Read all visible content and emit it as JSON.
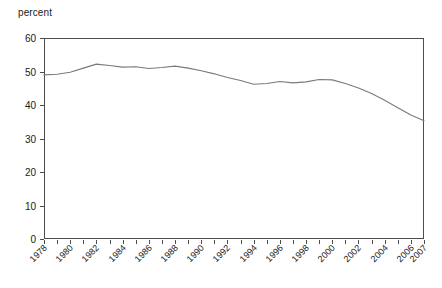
{
  "chart_data": {
    "type": "line",
    "title": "",
    "subtitle": "",
    "xlabel": "",
    "ylabel": "percent",
    "ylim": [
      0,
      60
    ],
    "xlim": [
      1978,
      2007
    ],
    "grid": false,
    "legend": null,
    "y_ticks": [
      0,
      10,
      20,
      30,
      40,
      50,
      60
    ],
    "y_tick_labels": [
      "0",
      "10",
      "20",
      "30",
      "40",
      "50",
      "60"
    ],
    "x_tick_labels": [
      "1978",
      "1980",
      "1982",
      "1984",
      "1986",
      "1988",
      "1990",
      "1992",
      "1994",
      "1996",
      "1998",
      "2000",
      "2002",
      "2004",
      "2006",
      "2007"
    ],
    "x_minor_ticks_every_year": true,
    "series": [
      {
        "name": "percent",
        "color": "#7a7a7a",
        "x": [
          1978,
          1979,
          1980,
          1981,
          1982,
          1983,
          1984,
          1985,
          1986,
          1987,
          1988,
          1989,
          1990,
          1991,
          1992,
          1993,
          1994,
          1995,
          1996,
          1997,
          1998,
          1999,
          2000,
          2001,
          2002,
          2003,
          2004,
          2005,
          2006,
          2007
        ],
        "values": [
          49.0,
          49.2,
          49.8,
          51.0,
          52.2,
          51.8,
          51.3,
          51.4,
          50.9,
          51.2,
          51.6,
          51.0,
          50.2,
          49.3,
          48.2,
          47.3,
          46.2,
          46.4,
          47.0,
          46.6,
          46.9,
          47.6,
          47.5,
          46.4,
          45.1,
          43.4,
          41.4,
          39.2,
          37.0,
          35.3
        ]
      }
    ],
    "axis_color": "#4d4d4d",
    "plot_box": {
      "left": 44,
      "top": 38,
      "right": 424,
      "bottom": 239
    }
  }
}
